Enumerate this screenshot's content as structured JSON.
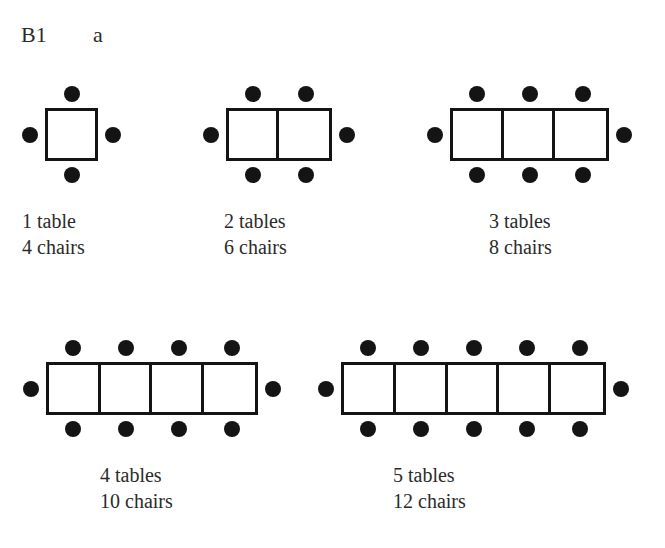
{
  "header": {
    "code": "B1",
    "part": "a"
  },
  "style": {
    "ink": "#141414",
    "text": "#2b2b2b",
    "paper": "#ffffff",
    "cell_size": 53,
    "border_width": 3,
    "chair_diameter": 16
  },
  "figures": [
    {
      "id": "figure-1-table",
      "tables": 1,
      "chairs": 4,
      "label_tables": "1 table",
      "label_chairs": "4 chairs",
      "diagram_left": 45,
      "diagram_top": 108,
      "caption_left": 22,
      "caption_top": 208
    },
    {
      "id": "figure-2-tables",
      "tables": 2,
      "chairs": 6,
      "label_tables": "2 tables",
      "label_chairs": "6 chairs",
      "diagram_left": 226,
      "diagram_top": 108,
      "caption_left": 224,
      "caption_top": 208
    },
    {
      "id": "figure-3-tables",
      "tables": 3,
      "chairs": 8,
      "label_tables": "3 tables",
      "label_chairs": "8 chairs",
      "diagram_left": 450,
      "diagram_top": 108,
      "caption_left": 489,
      "caption_top": 208
    },
    {
      "id": "figure-4-tables",
      "tables": 4,
      "chairs": 10,
      "label_tables": "4 tables",
      "label_chairs": "10 chairs",
      "diagram_left": 46,
      "diagram_top": 362,
      "caption_left": 100,
      "caption_top": 462
    },
    {
      "id": "figure-5-tables",
      "tables": 5,
      "chairs": 12,
      "label_tables": "5 tables",
      "label_chairs": "12 chairs",
      "diagram_left": 341,
      "diagram_top": 362,
      "caption_left": 393,
      "caption_top": 462
    }
  ],
  "pattern": {
    "type": "table",
    "description": "Growing pattern of square tables joined in a row with chairs around the perimeter",
    "columns": [
      "tables",
      "chairs"
    ],
    "rows": [
      [
        1,
        4
      ],
      [
        2,
        6
      ],
      [
        3,
        8
      ],
      [
        4,
        10
      ],
      [
        5,
        12
      ]
    ],
    "rule": "chairs = 2 * tables + 2"
  }
}
